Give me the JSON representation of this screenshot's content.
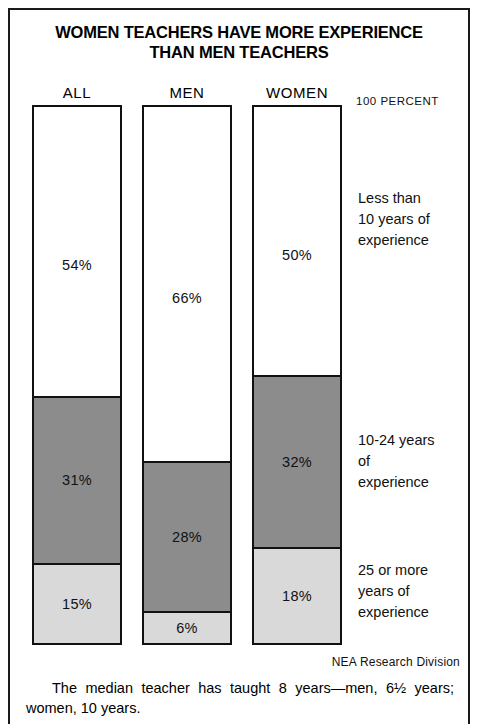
{
  "title": {
    "line1": "WOMEN TEACHERS HAVE MORE EXPERIENCE",
    "line2": "THAN MEN TEACHERS"
  },
  "scale_caption": "100 PERCENT",
  "source": "NEA Research Division",
  "caption": {
    "line1": "The median teacher has taught 8 years—men, 6½",
    "line2": "years; women, 10 years."
  },
  "legend": {
    "top": {
      "line1": "Less than",
      "line2": "10 years of",
      "line3": "experience"
    },
    "middle": {
      "line1": "10-24 years",
      "line2": "of",
      "line3": "experience"
    },
    "bottom": {
      "line1": "25 or more",
      "line2": "years of",
      "line3": "experience"
    }
  },
  "colors": {
    "less_than_10": "#ffffff",
    "ten_to_24": "#8c8c8c",
    "twenty_five_plus": "#d9d9d9",
    "outline": "#111111",
    "background": "#ffffff"
  },
  "columns": [
    {
      "header": "ALL",
      "segments": [
        {
          "key": "less_than_10",
          "label": "54%",
          "value": 54
        },
        {
          "key": "ten_to_24",
          "label": "31%",
          "value": 31
        },
        {
          "key": "twenty_five_plus",
          "label": "15%",
          "value": 15
        }
      ]
    },
    {
      "header": "MEN",
      "segments": [
        {
          "key": "less_than_10",
          "label": "66%",
          "value": 66
        },
        {
          "key": "ten_to_24",
          "label": "28%",
          "value": 28
        },
        {
          "key": "twenty_five_plus",
          "label": "6%",
          "value": 6
        }
      ]
    },
    {
      "header": "WOMEN",
      "segments": [
        {
          "key": "less_than_10",
          "label": "50%",
          "value": 50
        },
        {
          "key": "ten_to_24",
          "label": "32%",
          "value": 32
        },
        {
          "key": "twenty_five_plus",
          "label": "18%",
          "value": 18
        }
      ]
    }
  ],
  "chart_data": {
    "type": "bar",
    "subtype": "stacked-100-percent",
    "orientation": "vertical",
    "title": "WOMEN TEACHERS HAVE MORE EXPERIENCE THAN MEN TEACHERS",
    "subtitle": "",
    "xlabel": "",
    "ylabel": "",
    "ylim": [
      0,
      100
    ],
    "yunit": "percent",
    "grid": false,
    "legend_position": "right",
    "axis_annotation": "100 PERCENT",
    "source": "NEA Research Division",
    "note": "The median teacher has taught 8 years—men, 6½ years; women, 10 years.",
    "categories": [
      "ALL",
      "MEN",
      "WOMEN"
    ],
    "series": [
      {
        "name": "Less than 10 years of experience",
        "color": "#ffffff",
        "values": [
          54,
          66,
          50
        ]
      },
      {
        "name": "10-24 years of experience",
        "color": "#8c8c8c",
        "values": [
          31,
          28,
          32
        ]
      },
      {
        "name": "25 or more years of experience",
        "color": "#d9d9d9",
        "values": [
          15,
          6,
          18
        ]
      }
    ],
    "data_labels": [
      [
        "54%",
        "31%",
        "15%"
      ],
      [
        "66%",
        "28%",
        "6%"
      ],
      [
        "50%",
        "32%",
        "18%"
      ]
    ]
  }
}
